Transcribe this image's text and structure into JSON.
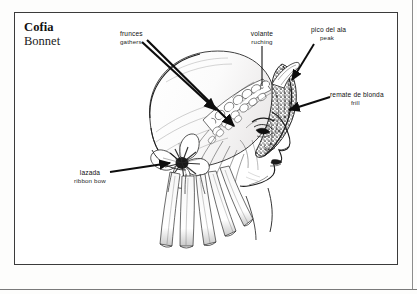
{
  "plate": {
    "title_es": "Cofia",
    "title_en": "Bonnet",
    "frame_color": "#3b3b3b",
    "background": "#ffffff",
    "ink_color": "#1d1d1d"
  },
  "callouts": [
    {
      "key": "gathers",
      "es": "frunces",
      "en": "gathers",
      "x": 120,
      "y": 30,
      "align": "left",
      "leaders": [
        {
          "from": [
            142,
            42
          ],
          "to": [
            218,
            111
          ],
          "head": true
        },
        {
          "from": [
            146,
            40
          ],
          "to": [
            236,
            127
          ],
          "head": true
        }
      ]
    },
    {
      "key": "ruching",
      "es": "volante",
      "en": "ruching",
      "x": 246,
      "y": 30,
      "align": "center",
      "leaders": [
        {
          "from": [
            262,
            46
          ],
          "to": [
            262,
            86
          ],
          "head": false
        }
      ]
    },
    {
      "key": "peak",
      "es": "pico del ala",
      "en": "peak",
      "x": 311,
      "y": 26,
      "align": "left",
      "leaders": [
        {
          "from": [
            312,
            44
          ],
          "to": [
            292,
            79
          ],
          "head": true
        }
      ]
    },
    {
      "key": "frill",
      "es": "remate de blonda",
      "en": "frill",
      "x": 330,
      "y": 92,
      "align": "left",
      "leaders": [
        {
          "from": [
            328,
            98
          ],
          "to": [
            288,
            110
          ],
          "head": true
        }
      ]
    },
    {
      "key": "ribbon-bow",
      "es": "lazada",
      "en": "ribbon bow",
      "x": 68,
      "y": 170,
      "align": "center",
      "leaders": [
        {
          "from": [
            112,
            172
          ],
          "to": [
            172,
            163
          ],
          "head": true
        }
      ]
    }
  ],
  "illustration": {
    "subject": "woman-head-profile-wearing-bonnet",
    "elements": [
      "head-profile",
      "bonnet-crown",
      "ruching-band",
      "lace-frill-band",
      "ribbon-bow",
      "ribbon-streamers"
    ]
  }
}
